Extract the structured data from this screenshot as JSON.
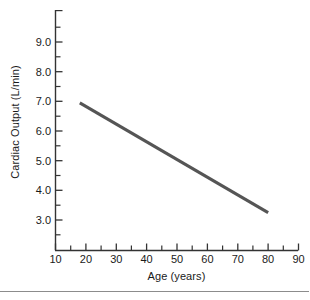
{
  "chart_data": {
    "type": "line",
    "title": "",
    "subtitle": "",
    "xlabel": "Age (years)",
    "ylabel": "Cardiac Output (L/min)",
    "xlim": [
      10,
      90
    ],
    "ylim": [
      2.5,
      9.5
    ],
    "xticks": [
      10,
      20,
      30,
      40,
      50,
      60,
      70,
      80,
      90
    ],
    "xtick_labels": [
      "10",
      "20",
      "30",
      "40",
      "50",
      "60",
      "70",
      "80",
      "90"
    ],
    "x_minor_tick_interval": 5,
    "yticks": [
      3.0,
      4.0,
      5.0,
      6.0,
      7.0,
      8.0,
      9.0
    ],
    "ytick_labels": [
      "3.0",
      "4.0",
      "5.0",
      "6.0",
      "7.0",
      "8.0",
      "9.0"
    ],
    "y_minor_tick_interval": 0.5,
    "grid": false,
    "legend": "none",
    "line_color": "#555555",
    "axis_color": "#333333",
    "series": [
      {
        "name": "Cardiac output vs age",
        "x": [
          18,
          80
        ],
        "values": [
          6.95,
          3.25
        ]
      }
    ],
    "annotations": []
  },
  "figure": {
    "y_axis_title": "Cardiac Output (L/min)",
    "x_axis_title": "Age (years)"
  }
}
